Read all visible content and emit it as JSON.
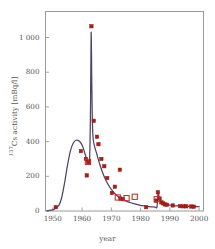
{
  "chart_data": {
    "type": "line",
    "title": "",
    "subtitle": "",
    "xlabel": "year",
    "ylabel_html": "<sup>137</sup>Cs activity [mBq/l]",
    "ylabel_plain": "137Cs activity [mBq/l]",
    "xlim": [
      1947.5,
      2001.5
    ],
    "ylim": [
      0,
      1150
    ],
    "xticks": [
      1950,
      1960,
      1970,
      1980,
      1990,
      2000
    ],
    "xtick_labels": [
      "1950",
      "1960",
      "1970",
      "1980",
      "1990",
      "2000"
    ],
    "yticks": [
      0,
      200,
      400,
      600,
      800,
      1000
    ],
    "ytick_labels": [
      "0",
      "200",
      "400",
      "600",
      "800",
      "1 000"
    ],
    "grid": false,
    "legend": "none",
    "frame": "box",
    "colors": {
      "curve": "#4e4464",
      "marker_fill": "#a52019",
      "marker_edge": "#8e1b14",
      "open_marker_edge": "#b0342a",
      "frame": "#9a9a9a",
      "text": "#555555",
      "background": "#ffffff"
    },
    "series": [
      {
        "name": "model curve",
        "style": "solid-line",
        "points": [
          {
            "x": 1948.0,
            "y": 2
          },
          {
            "x": 1950.0,
            "y": 6
          },
          {
            "x": 1951.0,
            "y": 18
          },
          {
            "x": 1952.0,
            "y": 30
          },
          {
            "x": 1953.0,
            "y": 75
          },
          {
            "x": 1954.0,
            "y": 160
          },
          {
            "x": 1955.0,
            "y": 262
          },
          {
            "x": 1956.0,
            "y": 345
          },
          {
            "x": 1957.0,
            "y": 392
          },
          {
            "x": 1958.0,
            "y": 408
          },
          {
            "x": 1959.0,
            "y": 403
          },
          {
            "x": 1960.0,
            "y": 380
          },
          {
            "x": 1961.0,
            "y": 330
          },
          {
            "x": 1961.7,
            "y": 288
          },
          {
            "x": 1962.2,
            "y": 278
          },
          {
            "x": 1962.6,
            "y": 310
          },
          {
            "x": 1962.9,
            "y": 620
          },
          {
            "x": 1963.1,
            "y": 1030
          },
          {
            "x": 1963.35,
            "y": 700
          },
          {
            "x": 1963.6,
            "y": 470
          },
          {
            "x": 1964.0,
            "y": 392
          },
          {
            "x": 1965.0,
            "y": 330
          },
          {
            "x": 1966.0,
            "y": 272
          },
          {
            "x": 1967.0,
            "y": 222
          },
          {
            "x": 1968.0,
            "y": 182
          },
          {
            "x": 1969.0,
            "y": 150
          },
          {
            "x": 1970.0,
            "y": 124
          },
          {
            "x": 1971.0,
            "y": 104
          },
          {
            "x": 1972.0,
            "y": 88
          },
          {
            "x": 1973.0,
            "y": 76
          },
          {
            "x": 1974.0,
            "y": 66
          },
          {
            "x": 1975.0,
            "y": 58
          },
          {
            "x": 1976.0,
            "y": 51
          },
          {
            "x": 1977.0,
            "y": 46
          },
          {
            "x": 1978.0,
            "y": 41
          },
          {
            "x": 1979.0,
            "y": 37
          },
          {
            "x": 1980.0,
            "y": 33
          },
          {
            "x": 1981.0,
            "y": 30
          },
          {
            "x": 1982.0,
            "y": 27
          },
          {
            "x": 1983.0,
            "y": 25
          },
          {
            "x": 1984.0,
            "y": 24
          },
          {
            "x": 1985.0,
            "y": 23
          },
          {
            "x": 1985.6,
            "y": 24
          },
          {
            "x": 1986.0,
            "y": 108
          },
          {
            "x": 1986.4,
            "y": 70
          },
          {
            "x": 1987.0,
            "y": 52
          },
          {
            "x": 1988.0,
            "y": 42
          },
          {
            "x": 1989.0,
            "y": 37
          },
          {
            "x": 1990.0,
            "y": 34
          },
          {
            "x": 1991.0,
            "y": 32
          },
          {
            "x": 1992.0,
            "y": 30
          },
          {
            "x": 1993.0,
            "y": 29
          },
          {
            "x": 1994.0,
            "y": 28
          },
          {
            "x": 1995.0,
            "y": 27
          },
          {
            "x": 1996.0,
            "y": 26
          },
          {
            "x": 1997.0,
            "y": 26
          },
          {
            "x": 1998.0,
            "y": 25
          },
          {
            "x": 2000.0,
            "y": 25
          }
        ]
      },
      {
        "name": "measurements (filled squares)",
        "style": "filled-square-markers",
        "points": [
          {
            "x": 1951.0,
            "y": 22
          },
          {
            "x": 1959.6,
            "y": 345
          },
          {
            "x": 1961.3,
            "y": 300
          },
          {
            "x": 1961.6,
            "y": 205
          },
          {
            "x": 1962.0,
            "y": 283
          },
          {
            "x": 1963.2,
            "y": 1065
          },
          {
            "x": 1964.0,
            "y": 520
          },
          {
            "x": 1965.1,
            "y": 428
          },
          {
            "x": 1965.6,
            "y": 385
          },
          {
            "x": 1966.6,
            "y": 300
          },
          {
            "x": 1967.6,
            "y": 258
          },
          {
            "x": 1968.6,
            "y": 190
          },
          {
            "x": 1970.2,
            "y": 104
          },
          {
            "x": 1971.2,
            "y": 140
          },
          {
            "x": 1972.9,
            "y": 238
          },
          {
            "x": 1973.1,
            "y": 72
          },
          {
            "x": 1974.0,
            "y": 68
          },
          {
            "x": 1981.9,
            "y": 22
          },
          {
            "x": 1985.3,
            "y": 60
          },
          {
            "x": 1985.9,
            "y": 108
          },
          {
            "x": 1986.5,
            "y": 72
          },
          {
            "x": 1987.1,
            "y": 50
          },
          {
            "x": 1987.7,
            "y": 44
          },
          {
            "x": 1988.3,
            "y": 38
          },
          {
            "x": 1989.0,
            "y": 36
          },
          {
            "x": 1991.0,
            "y": 32
          },
          {
            "x": 1993.5,
            "y": 28
          },
          {
            "x": 1994.6,
            "y": 27
          },
          {
            "x": 1995.6,
            "y": 27
          },
          {
            "x": 1997.3,
            "y": 26
          },
          {
            "x": 1998.2,
            "y": 25
          }
        ]
      },
      {
        "name": "measurements (open squares)",
        "style": "open-square-markers",
        "points": [
          {
            "x": 1962.0,
            "y": 283
          },
          {
            "x": 1972.2,
            "y": 78
          },
          {
            "x": 1975.2,
            "y": 74
          },
          {
            "x": 1978.0,
            "y": 82
          },
          {
            "x": 1985.5,
            "y": 68
          }
        ]
      }
    ]
  }
}
